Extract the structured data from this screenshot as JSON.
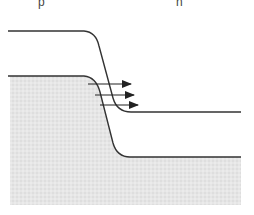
{
  "labels": {
    "p_side": "p",
    "n_side": "n"
  },
  "colors": {
    "line": "#333333",
    "fill": "#e4e4e4",
    "background": "#ffffff"
  },
  "diagram": {
    "upper_band": {
      "left_level_y": 31,
      "right_level_y": 112,
      "x_start": 8,
      "x_end": 241
    },
    "lower_band": {
      "left_level_y": 76,
      "right_level_y": 157,
      "x_start": 8,
      "x_end": 241,
      "filled_below": true
    },
    "arrows": [
      {
        "x1": 88,
        "y": 84,
        "x2": 131
      },
      {
        "x1": 95,
        "y": 95,
        "x2": 134
      },
      {
        "x1": 100,
        "y": 105,
        "x2": 138
      }
    ]
  }
}
